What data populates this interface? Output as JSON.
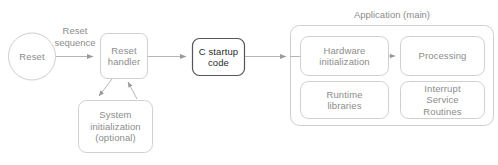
{
  "diagram": {
    "colors": {
      "stroke_light": "#cfcfcf",
      "stroke_dark": "#555555",
      "text_light": "#8c8c8c",
      "text_dark": "#2b2b2b",
      "arrow": "#9a9a9a",
      "background": "#ffffff"
    },
    "nodes": {
      "reset": {
        "label": "Reset",
        "shape": "circle"
      },
      "reset_handler": {
        "label": "Reset\nhandler",
        "shape": "rounded-rect"
      },
      "system_init": {
        "label": "System\ninitialization\n(optional)",
        "shape": "rounded-rect"
      },
      "c_startup": {
        "label": "C startup\ncode",
        "shape": "rounded-rect-emphasis"
      },
      "hardware_init": {
        "label": "Hardware\ninitialization",
        "shape": "rounded-rect"
      },
      "processing": {
        "label": "Processing",
        "shape": "rounded-rect"
      },
      "runtime_libraries": {
        "label": "Runtime\nlibraries",
        "shape": "rounded-rect"
      },
      "interrupt_service_routines": {
        "label": "Interrupt\nService\nRoutines",
        "shape": "rounded-rect"
      }
    },
    "groups": {
      "application": {
        "title": "Application (main)"
      }
    },
    "edges": [
      {
        "from": "reset",
        "to": "reset_handler",
        "label": "Reset\nsequence"
      },
      {
        "from": "reset_handler",
        "to": "system_init",
        "label": ""
      },
      {
        "from": "system_init",
        "to": "reset_handler",
        "label": ""
      },
      {
        "from": "reset_handler",
        "to": "c_startup",
        "label": ""
      },
      {
        "from": "c_startup",
        "to": "hardware_init",
        "label": ""
      },
      {
        "from": "hardware_init",
        "to": "processing",
        "label": ""
      }
    ]
  }
}
